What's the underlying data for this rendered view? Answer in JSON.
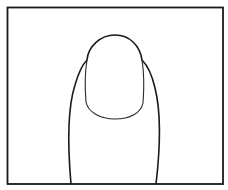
{
  "illustration": {
    "subject": "fingertip with nail",
    "colors": {
      "background": "#ffffff",
      "stroke": "#1a1a1a"
    }
  }
}
